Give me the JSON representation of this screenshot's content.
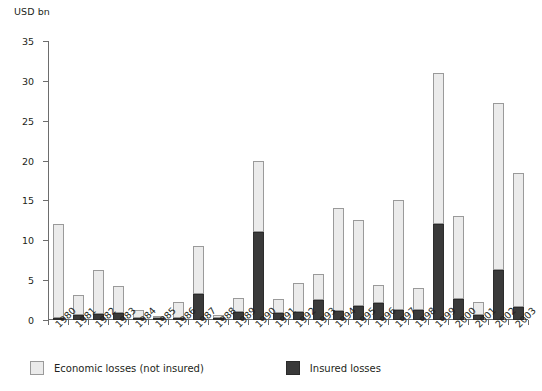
{
  "chart_data": {
    "type": "bar",
    "stacked": true,
    "title": "",
    "subtitle": "",
    "xlabel": "",
    "ylabel": "USD bn",
    "ylim": [
      0,
      35
    ],
    "yticks": [
      0,
      5,
      10,
      15,
      20,
      25,
      30,
      35
    ],
    "grid": false,
    "legend_position": "bottom-left",
    "categories": [
      "1980",
      "1981",
      "1982",
      "1983",
      "1984",
      "1985",
      "1986",
      "1987",
      "1988",
      "1989",
      "1990",
      "1991",
      "1992",
      "1993",
      "1994",
      "1995",
      "1996",
      "1997",
      "1998",
      "1999",
      "2000",
      "2001",
      "2002",
      "2003"
    ],
    "series": [
      {
        "name": "Insured losses",
        "color": "#3a3a3a",
        "values": [
          0.2,
          0.6,
          0.7,
          0.9,
          0.3,
          0.2,
          0.3,
          3.3,
          0.3,
          1.0,
          11.0,
          0.9,
          1.0,
          2.5,
          1.1,
          1.8,
          2.1,
          1.2,
          1.2,
          12.0,
          2.6,
          0.6,
          6.3,
          1.6
        ]
      },
      {
        "name": "Economic losses (not insured)",
        "color": "#ebebeb",
        "values": [
          11.8,
          2.6,
          5.6,
          3.4,
          0.9,
          0.3,
          1.9,
          6.0,
          0.3,
          1.8,
          9.0,
          1.7,
          3.6,
          3.3,
          12.9,
          10.8,
          2.3,
          13.8,
          2.8,
          19.0,
          10.4,
          1.7,
          20.9,
          16.9
        ]
      }
    ],
    "totals": [
      12.0,
      3.2,
      6.3,
      4.3,
      1.2,
      0.5,
      2.2,
      9.3,
      0.6,
      2.8,
      20.0,
      2.6,
      4.6,
      5.8,
      14.0,
      12.6,
      4.4,
      15.0,
      4.0,
      31.0,
      13.0,
      2.3,
      27.2,
      18.5
    ]
  },
  "legend": {
    "items": [
      {
        "label": "Economic losses (not insured)",
        "icon": "legend-swatch-light"
      },
      {
        "label": "Insured losses",
        "icon": "legend-swatch-dark"
      }
    ]
  }
}
